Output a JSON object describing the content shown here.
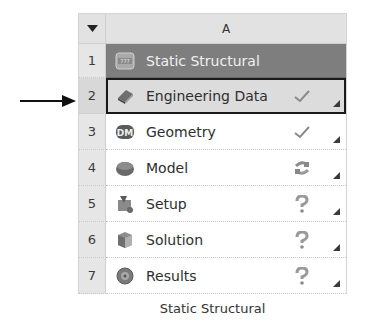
{
  "system": {
    "column_header": "A",
    "collapse_icon": "triangle-down-icon",
    "caption": "Static Structural",
    "title_row": {
      "num": "1",
      "label": "Static Structural",
      "icon": "static-structural-icon"
    },
    "cells": [
      {
        "num": "2",
        "label": "Engineering Data",
        "icon": "engineering-data-icon",
        "status": "check-icon",
        "status_glyph": "✓",
        "selected": true
      },
      {
        "num": "3",
        "label": "Geometry",
        "icon": "geometry-dm-icon",
        "status": "check-icon",
        "status_glyph": "✓"
      },
      {
        "num": "4",
        "label": "Model",
        "icon": "model-icon",
        "status": "refresh-required-icon",
        "status_glyph": "⟳"
      },
      {
        "num": "5",
        "label": "Setup",
        "icon": "setup-icon",
        "status": "attention-required-icon",
        "status_glyph": "?"
      },
      {
        "num": "6",
        "label": "Solution",
        "icon": "solution-icon",
        "status": "attention-required-icon",
        "status_glyph": "?"
      },
      {
        "num": "7",
        "label": "Results",
        "icon": "results-icon",
        "status": "attention-required-icon",
        "status_glyph": "?"
      }
    ]
  },
  "annotation": {
    "arrow_target_row": "2"
  },
  "colors": {
    "title_row_bg": "#7e7e7e",
    "selected_border": "#1a1a1a",
    "header_bg": "#e2e2e2"
  }
}
